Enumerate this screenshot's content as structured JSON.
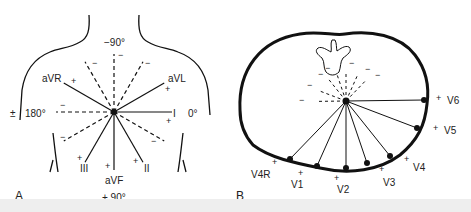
{
  "panels": {
    "a": {
      "label": "A",
      "degrees": {
        "top": "−90°",
        "left": "180°",
        "right": "0°",
        "bottom": "+ 90°"
      },
      "leads": [
        {
          "name": "aVR",
          "angle": -150
        },
        {
          "name": "aVL",
          "angle": -30
        },
        {
          "name": "I",
          "angle": 0
        },
        {
          "name": "II",
          "angle": 60
        },
        {
          "name": "aVF",
          "angle": 90
        },
        {
          "name": "III",
          "angle": 120
        }
      ],
      "plus_sign": "+",
      "minus_sign": "−",
      "plusminus_sign": "±"
    },
    "b": {
      "label": "B",
      "leads": [
        {
          "name": "V4R"
        },
        {
          "name": "V1"
        },
        {
          "name": "V2"
        },
        {
          "name": "V3"
        },
        {
          "name": "V4"
        },
        {
          "name": "V5"
        },
        {
          "name": "V6"
        }
      ],
      "plus_sign": "+",
      "minus_sign": "−"
    }
  }
}
